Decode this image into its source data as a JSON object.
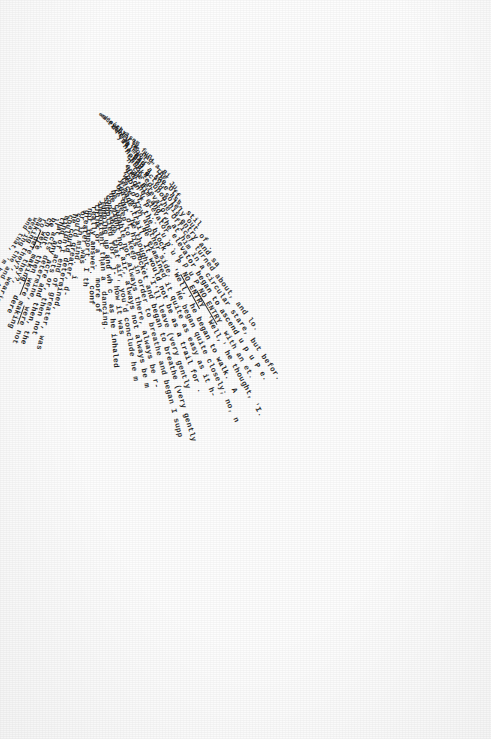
{
  "document": {
    "kind": "typewritten-manuscript-page",
    "title": "",
    "page_background": "#fdfdfd",
    "ink_color": "#141414",
    "layout": "fan",
    "note": "Lines of typewriter text radiate from an apex near the upper-left and rotate progressively clockwise, forming a triangular wedge."
  },
  "apex": {
    "x": 96,
    "y": 112
  },
  "fan": {
    "start_angle_deg": 34,
    "end_angle_deg": 146,
    "line_count": 46,
    "font_size_px": 7.6
  },
  "lines": [
    {
      "text": "er",
      "angle": 31.5,
      "radius": 4,
      "size": 5.4
    },
    {
      "text": "ed) '",
      "angle": 33.5,
      "radius": 6,
      "size": 5.6
    },
    {
      "text": "a such a",
      "angle": 35.5,
      "radius": 9,
      "size": 6.0
    },
    {
      "text": "to try som",
      "angle": 37.5,
      "radius": 12,
      "size": 6.3
    },
    {
      "text": "ticularly fun.",
      "angle": 39.5,
      "radius": 16,
      "size": 6.6
    },
    {
      "text": "denly he had a Bi",
      "angle": 41.5,
      "radius": 21,
      "size": 6.9
    },
    {
      "text": "re a fool.\" The Ju",
      "angle": 43.5,
      "radius": 27,
      "size": 7.1
    },
    {
      "text": "you may.\"  The Off.",
      "angle": 45.5,
      "radius": 33,
      "size": 7.3
    },
    {
      "text": "ill had a sore ass, stil",
      "angle": 47.5,
      "radius": 38,
      "size": 7.4
    },
    {
      "text": "he had acted solely out of .",
      "angle": 49.5,
      "radius": 43,
      "size": 7.5
    },
    {
      "text": "noted R. upon his entry and sa",
      "angle": 51.5,
      "radius": 48,
      "size": 7.6
    },
    {
      "text": "chuckled.  The Officer turned about, and lo.",
      "angle": 53.5,
      "radius": 53,
      "size": 7.6
    },
    {
      "text": "n the elevator, at him in a circular stare, but befor.",
      "angle": 55.5,
      "radius": 57,
      "size": 7.6
    },
    {
      "text": ", at him and the elevator began to ascend u p u P e.",
      "angle": 57.5,
      "radius": 60,
      "size": 7.6
    },
    {
      "text": "and the elevator ... u p u P NO ENTRY  with an et.",
      "angle": 59.5,
      "radius": 62,
      "size": 7.6
    },
    {
      "text": "ation u p ...  u p u P  NO ENTRY  'Well,' he thought, 'I.",
      "angle": 61.5,
      "radius": 64,
      "size": 7.6
    },
    {
      "text": "roof of. the block.   'Well,' he began to walk.  A",
      "angle": 63.5,
      "radius": 66,
      "size": 7.6
    },
    {
      "text": "ve to try another side.   He began quite closely; no, n",
      "angle": 65.5,
      "radius": 68,
      "size": 7.6
    },
    {
      "text": "face wall. He examined it quite as easy as it h-",
      "angle": 67.5,
      "radius": 70,
      "size": 7.6
    },
    {
      "text": "y-made trail. It would not be as a trail for .",
      "angle": 69.5,
      "radius": 72,
      "size": 7.6
    },
    {
      "text": "least,' he thought. 'I'll leave (very gently",
      "angle": 71.5,
      "radius": 74,
      "size": 7.6
    },
    {
      "text": "on out of his pocket and began to breathe (very gently",
      "angle": 73.5,
      "radius": 76,
      "size": 7.6
    },
    {
      "text": "le deep to keep in order to breathe and began I supp",
      "angle": 75.5,
      "radius": 78,
      "size": 7.6
    },
    {
      "text": "be capable not always there, always be r-",
      "angle": 77.5,
      "radius": 80,
      "size": 7.6
    },
    {
      "text": "he might not air, always not always be m",
      "angle": 79.5,
      "radius": 82,
      "size": 7.6
    },
    {
      "text": "conclude that air, you'd conclude he m",
      "angle": 81.5,
      "radius": 84,
      "size": 7.6
    },
    {
      "text": "supplied for, j-  how it was",
      "angle": 83.5,
      "radius": 86,
      "size": 7.6
    },
    {
      "text": "jumping up and wh c  as he inhaled",
      "angle": 85.5,
      "radius": 88,
      "size": 7.6
    },
    {
      "text": "important than a  dancing.",
      "angle": 87.5,
      "radius": 90,
      "size": 7.6
    },
    {
      "text": "think or a '.  more of",
      "angle": 89.5,
      "radius": 92,
      "size": 7.6
    },
    {
      "text": "really answer.  conf",
      "angle": 91.5,
      "radius": 94,
      "size": 7.6
    },
    {
      "text": "not import. I th",
      "angle": 93.5,
      "radius": 96,
      "size": 7.6
    },
    {
      "text": "greater was",
      "angle": 95.5,
      "radius": 98,
      "size": 7.6
    },
    {
      "text": "or in mind.  i",
      "angle": 97.5,
      "radius": 100,
      "size": 7.6
    },
    {
      "text": "could greater, d-",
      "angle": 99.5,
      "radius": 102,
      "size": 7.6
    },
    {
      "text": "he could determined,",
      "angle": 101.5,
      "radius": 104,
      "size": 7.6
    },
    {
      "text": "couldn't end of greater, was",
      "angle": 103.5,
      "radius": 106,
      "size": 7.6
    },
    {
      "text": "mind of acts or, then not",
      "angle": 105.5,
      "radius": 108,
      "size": 7.6
    },
    {
      "text": "that any acre and then, the",
      "angle": 107.5,
      "radius": 110,
      "size": 7.6
    },
    {
      "text": "-r acts determine, were not",
      "angle": 109.5,
      "radius": 112,
      "size": 7.6
    },
    {
      "text": "be out, then were making",
      "angle": 111.5,
      "radius": 114,
      "size": 7.6
    },
    {
      "text": "ch were making.  dere",
      "angle": 113.5,
      "radius": 116,
      "size": 7.6
    },
    {
      "text": "ro- dere they?,",
      "angle": 115.5,
      "radius": 118,
      "size": 7.5
    },
    {
      "text": "making they?, wearing the",
      "angle": 117.5,
      "radius": 120,
      "size": 7.3
    },
    {
      "text": "wearing the and that,",
      "angle": 119.5,
      "radius": 122,
      "size": 7.1
    },
    {
      "text": "and that, 'm b",
      "angle": 121.5,
      "radius": 124,
      "size": 6.8
    }
  ],
  "emphasis": {
    "underlined_phrases": [
      "NO ENTRY",
      "were",
      "WAS"
    ],
    "quoted_phrases": [
      "'Well,'",
      "'I'll leave",
      "they?'"
    ]
  },
  "colors": {
    "paper": "#fdfdfd",
    "ink": "#141414",
    "vignette": "rgba(0,0,0,0.035)"
  }
}
